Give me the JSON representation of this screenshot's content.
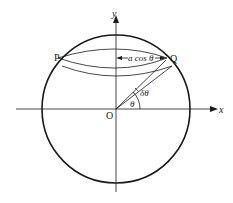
{
  "diagram": {
    "title": "",
    "labels": {
      "x_axis": "x",
      "y_axis": "y",
      "origin": "O",
      "point_p": "P",
      "point_q": "Q",
      "radius_label": "a cos θ",
      "angle_theta": "θ",
      "angle_delta_theta": "δθ"
    },
    "colors": {
      "stroke": "#1a1a1a",
      "background": "#ffffff"
    }
  }
}
